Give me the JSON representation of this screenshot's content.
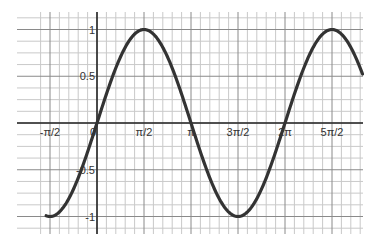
{
  "chart_data": {
    "type": "line",
    "title": "",
    "xlabel": "",
    "ylabel": "",
    "function": "y = sin(x)",
    "series": [
      {
        "name": "sin(x)",
        "color": "#333333",
        "x": [
          -1.7,
          -1.5708,
          -1.0472,
          -0.5236,
          0,
          0.5236,
          1.0472,
          1.5708,
          2.0944,
          2.618,
          3.1416,
          3.6652,
          4.1888,
          4.7124,
          5.236,
          5.7596,
          6.2832,
          6.8068,
          7.3304,
          7.854,
          8.3776,
          8.9
        ],
        "values": [
          -0.99,
          -1,
          -0.866,
          -0.5,
          0,
          0.5,
          0.866,
          1,
          0.866,
          0.5,
          0,
          -0.5,
          -0.866,
          -1,
          -0.866,
          -0.5,
          0,
          0.5,
          0.866,
          1,
          0.866,
          0.5
        ]
      }
    ],
    "xlim": [
      -1.7,
      8.9
    ],
    "ylim": [
      -1.15,
      1.15
    ],
    "x_ticks": [
      {
        "value": -1.5708,
        "label": "-π/2"
      },
      {
        "value": 0,
        "label": "0"
      },
      {
        "value": 1.5708,
        "label": "π/2"
      },
      {
        "value": 3.1416,
        "label": "π"
      },
      {
        "value": 4.7124,
        "label": "3π/2"
      },
      {
        "value": 6.2832,
        "label": "2π"
      },
      {
        "value": 7.854,
        "label": "5π/2"
      }
    ],
    "y_ticks": [
      {
        "value": 1,
        "label": "1"
      },
      {
        "value": 0.5,
        "label": "0.5"
      },
      {
        "value": -0.5,
        "label": "-0.5"
      },
      {
        "value": -1,
        "label": "-1"
      }
    ],
    "grid": true,
    "legend": "none",
    "colors": {
      "background": "#ffffff",
      "curve": "#333333",
      "axis": "#2a2a2a",
      "major_grid": "#8a8a8a",
      "minor_grid": "#c9c9c9",
      "label": "#333333"
    }
  }
}
